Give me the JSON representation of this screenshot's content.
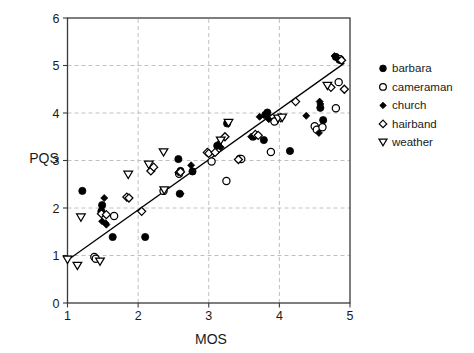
{
  "chart_data": {
    "type": "scatter",
    "title": "",
    "xlabel": "MOS",
    "ylabel": "PQS",
    "xlim": [
      1,
      5
    ],
    "ylim": [
      0,
      6
    ],
    "xticks": [
      1,
      2,
      3,
      4,
      5
    ],
    "yticks": [
      0,
      1,
      2,
      3,
      4,
      5,
      6
    ],
    "xtick_labels": [
      "1",
      "2",
      "3",
      "4",
      "5"
    ],
    "ytick_labels": [
      "0",
      "1",
      "2",
      "3",
      "4",
      "5",
      "6"
    ],
    "grid": "dashed-gray, y at 1..5 and x at 2,3,4",
    "legend_position": "right-outside-top",
    "trend_line": {
      "label": "regression line",
      "x1": 1.0,
      "y1": 0.9,
      "x2": 4.92,
      "y2": 5.05
    },
    "series": [
      {
        "name": "barbara",
        "marker": "filled-circle",
        "color": "#000000",
        "points": [
          [
            1.21,
            2.36
          ],
          [
            1.49,
            2.06
          ],
          [
            1.48,
            1.93
          ],
          [
            1.64,
            1.39
          ],
          [
            2.1,
            1.39
          ],
          [
            2.57,
            3.03
          ],
          [
            2.6,
            2.78
          ],
          [
            2.59,
            2.3
          ],
          [
            2.77,
            2.77
          ],
          [
            3.12,
            3.31
          ],
          [
            3.26,
            3.78
          ],
          [
            3.44,
            3.04
          ],
          [
            3.63,
            3.5
          ],
          [
            3.78,
            3.43
          ],
          [
            3.83,
            4.01
          ],
          [
            3.8,
            3.96
          ],
          [
            3.94,
            3.83
          ],
          [
            4.15,
            3.2
          ],
          [
            4.58,
            4.11
          ],
          [
            4.62,
            3.85
          ],
          [
            4.8,
            5.18
          ],
          [
            4.85,
            5.12
          ]
        ]
      },
      {
        "name": "cameraman",
        "marker": "open-circle",
        "color": "#000000",
        "points": [
          [
            1.38,
            0.97
          ],
          [
            1.4,
            0.93
          ],
          [
            1.66,
            1.83
          ],
          [
            2.36,
            2.36
          ],
          [
            2.58,
            2.72
          ],
          [
            3.04,
            2.98
          ],
          [
            3.25,
            2.57
          ],
          [
            3.46,
            3.03
          ],
          [
            3.88,
            3.18
          ],
          [
            3.93,
            3.82
          ],
          [
            4.5,
            3.72
          ],
          [
            4.53,
            3.65
          ],
          [
            4.61,
            3.7
          ],
          [
            4.8,
            4.1
          ],
          [
            4.84,
            4.65
          ],
          [
            4.86,
            5.13
          ]
        ]
      },
      {
        "name": "church",
        "marker": "filled-diamond",
        "color": "#000000",
        "points": [
          [
            1.52,
            2.21
          ],
          [
            1.49,
            1.72
          ],
          [
            1.54,
            1.68
          ],
          [
            1.55,
            1.65
          ],
          [
            2.57,
            2.75
          ],
          [
            2.6,
            2.3
          ],
          [
            2.75,
            2.9
          ],
          [
            3.13,
            3.34
          ],
          [
            3.17,
            3.28
          ],
          [
            3.6,
            3.5
          ],
          [
            3.72,
            3.92
          ],
          [
            3.85,
            3.87
          ],
          [
            4.38,
            3.94
          ],
          [
            4.57,
            4.24
          ],
          [
            4.58,
            4.19
          ],
          [
            4.56,
            3.58
          ],
          [
            4.78,
            5.2
          ],
          [
            4.82,
            5.15
          ]
        ]
      },
      {
        "name": "hairband",
        "marker": "open-diamond",
        "color": "#000000",
        "points": [
          [
            1.48,
            1.88
          ],
          [
            1.55,
            1.86
          ],
          [
            1.84,
            2.23
          ],
          [
            1.87,
            2.21
          ],
          [
            2.05,
            1.93
          ],
          [
            2.18,
            2.78
          ],
          [
            2.22,
            2.86
          ],
          [
            2.6,
            2.76
          ],
          [
            2.98,
            3.17
          ],
          [
            3.0,
            3.15
          ],
          [
            3.09,
            3.17
          ],
          [
            3.23,
            3.5
          ],
          [
            3.42,
            3.02
          ],
          [
            3.66,
            3.55
          ],
          [
            3.7,
            3.53
          ],
          [
            4.02,
            3.9
          ],
          [
            4.23,
            4.24
          ],
          [
            4.73,
            4.54
          ],
          [
            4.92,
            4.5
          ],
          [
            4.88,
            5.11
          ]
        ]
      },
      {
        "name": "weather",
        "marker": "open-triangle-down",
        "color": "#000000",
        "points": [
          [
            1.0,
            0.91
          ],
          [
            1.14,
            0.78
          ],
          [
            1.19,
            1.8
          ],
          [
            1.46,
            0.87
          ],
          [
            1.86,
            2.7
          ],
          [
            2.15,
            2.91
          ],
          [
            2.36,
            3.17
          ],
          [
            2.37,
            2.37
          ],
          [
            3.17,
            3.42
          ],
          [
            3.28,
            3.79
          ],
          [
            3.98,
            3.88
          ],
          [
            4.04,
            3.9
          ],
          [
            4.68,
            4.57
          ]
        ]
      }
    ]
  },
  "legend": {
    "items": [
      {
        "label": "barbara",
        "marker": "filled-circle"
      },
      {
        "label": "cameraman",
        "marker": "open-circle"
      },
      {
        "label": "church",
        "marker": "filled-diamond"
      },
      {
        "label": "hairband",
        "marker": "open-diamond"
      },
      {
        "label": "weather",
        "marker": "open-triangle-down"
      }
    ]
  },
  "colors": {
    "marker": "#000000",
    "axis": "#3a3a3a",
    "grid": "#b9b9b9",
    "background": "#ffffff"
  }
}
